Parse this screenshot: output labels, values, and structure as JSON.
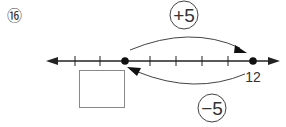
{
  "problem": {
    "number": "⑯"
  },
  "number_line": {
    "tick_count": 7,
    "start_point_value": "",
    "end_point_label": "12",
    "points": [
      "start",
      "end"
    ]
  },
  "jumps": {
    "forward": {
      "label": "+5",
      "from": "start",
      "to": "12"
    },
    "backward": {
      "label": "−5",
      "from": "12",
      "to": "start"
    }
  },
  "answer_box": {
    "value": ""
  },
  "colors": {
    "stroke": "#222222",
    "box": "#888888"
  }
}
